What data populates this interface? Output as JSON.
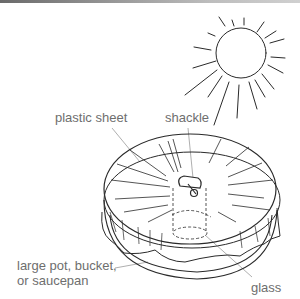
{
  "diagram": {
    "title": "",
    "labels": {
      "plastic_sheet": "plastic sheet",
      "shackle": "shackle",
      "pot_line1": "large pot, bucket,",
      "pot_line2": "or saucepan",
      "glass": "glass"
    },
    "elements": {
      "sun": "sun-icon",
      "container": "large pot with plastic sheet cover",
      "weight": "shackle",
      "inner_vessel": "glass (dashed, under sheet)"
    },
    "colors": {
      "line": "#2a2a2a",
      "label_text": "#6e6e6e",
      "leader_line": "#9a9a9a"
    }
  }
}
